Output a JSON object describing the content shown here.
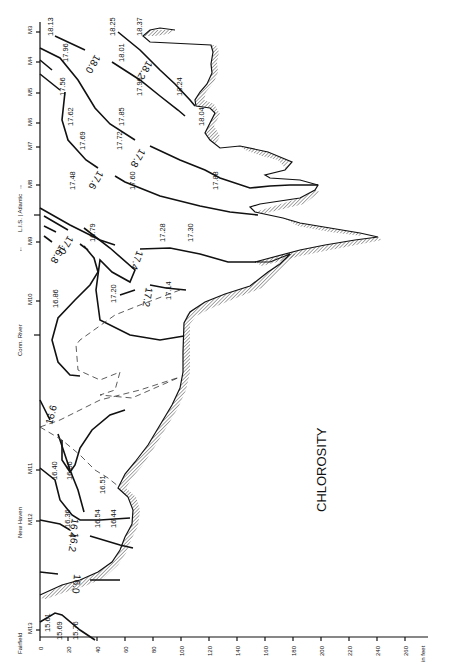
{
  "figure": {
    "title": "CHLOROSITY",
    "orientation": "rotated 90° counter-clockwise",
    "depth_axis": {
      "unit_label": "in feet",
      "ticks": [
        "0",
        "20",
        "40",
        "60",
        "80",
        "100",
        "120",
        "140",
        "160",
        "180",
        "200",
        "220",
        "240",
        "260"
      ]
    },
    "station_axis": {
      "stations": [
        "M3",
        "M4",
        "M5",
        "M6",
        "M7",
        "M8",
        "M9",
        "M10",
        "M11",
        "M12",
        "M13"
      ],
      "place_labels": [
        "Fairfield",
        "New Haven",
        "Conn. River",
        "L.I.S. | Atlantic"
      ],
      "arrow_left": "←",
      "arrow_right": "→"
    },
    "isolines": [
      "16.0",
      "16.2",
      "16.4",
      "16.6",
      "16.8",
      "17.0",
      "17.2",
      "17.4",
      "17.6",
      "17.8",
      "18.0",
      "18.2"
    ],
    "point_values": {
      "m13": [
        "15.61",
        "15.69",
        "15.76"
      ],
      "m12": [
        "16.36",
        "16.54",
        "16.44"
      ],
      "m11": [
        "16.40",
        "16.56",
        "16.51"
      ],
      "m10": [
        "16.86",
        "17.20",
        "17.14"
      ],
      "m9": [
        "16.79",
        "17.28",
        "17.30"
      ],
      "m8": [
        "17.48",
        "17.60",
        "17.88"
      ],
      "m7": [
        "17.69",
        "17.72"
      ],
      "m6": [
        "17.62",
        "17.85",
        "18.04"
      ],
      "m5": [
        "17.56",
        "17.96",
        "18.24"
      ],
      "m4": [
        "17.96",
        "18.01"
      ],
      "m3": [
        "18.13",
        "18.25",
        "18.37"
      ]
    }
  }
}
